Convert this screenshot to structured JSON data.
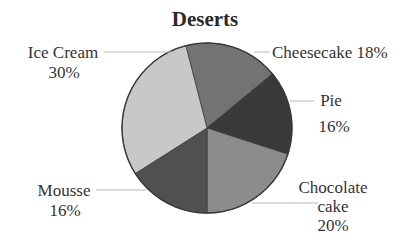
{
  "chart_data": {
    "type": "pie",
    "title": "Deserts",
    "categories": [
      "Cheesecake",
      "Pie",
      "Chocolate cake",
      "Mousse",
      "Ice Cream"
    ],
    "values": [
      18,
      16,
      20,
      16,
      30
    ],
    "unit": "%",
    "colors": [
      "#737373",
      "#3a3a3a",
      "#8c8c8c",
      "#505050",
      "#c8c8c8"
    ],
    "start_angle_deg_clockwise_from_top": -14.4,
    "legend": "none (direct labels with leader lines)",
    "labels": [
      {
        "name": "Cheesecake",
        "lines": [
          "Cheesecake 18%"
        ]
      },
      {
        "name": "Pie",
        "lines": [
          "Pie",
          "16%"
        ]
      },
      {
        "name": "Chocolate cake",
        "lines": [
          "Chocolate",
          "cake",
          "20%"
        ]
      },
      {
        "name": "Mousse",
        "lines": [
          "Mousse",
          "16%"
        ]
      },
      {
        "name": "Ice Cream",
        "lines": [
          "Ice Cream",
          "30%"
        ]
      }
    ]
  },
  "title": "Deserts",
  "labels": {
    "cheesecake": {
      "line1": "Cheesecake 18%"
    },
    "pie": {
      "line1": "Pie",
      "line2": "16%"
    },
    "chocolate": {
      "line1": "Chocolate",
      "line2": "cake",
      "line3": "20%"
    },
    "mousse": {
      "line1": "Mousse",
      "line2": "16%"
    },
    "icecream": {
      "line1": "Ice Cream",
      "line2": "30%"
    }
  }
}
